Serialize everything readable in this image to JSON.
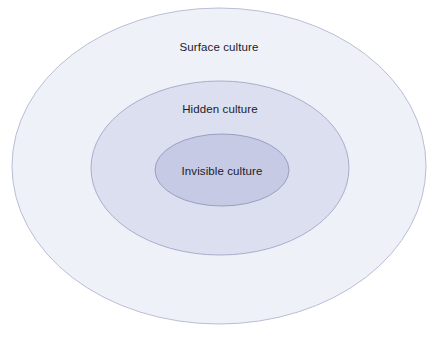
{
  "diagram": {
    "type": "concentric-ellipses",
    "background_color": "#ffffff",
    "title": "",
    "layers": [
      {
        "id": "surface",
        "label": "Surface culture",
        "order": 1,
        "position": "outer",
        "fill_color": "#eef1f8",
        "stroke_color": "#b9bed6",
        "center": {
          "x": 219,
          "y": 166
        },
        "radius": {
          "x": 207,
          "y": 158
        },
        "label_position": {
          "x": 219,
          "y": 48
        }
      },
      {
        "id": "hidden",
        "label": "Hidden culture",
        "order": 2,
        "position": "middle",
        "fill_color": "#dcdff0",
        "stroke_color": "#a9aecb",
        "center": {
          "x": 220,
          "y": 168
        },
        "radius": {
          "x": 129,
          "y": 87
        },
        "label_position": {
          "x": 220,
          "y": 110
        }
      },
      {
        "id": "invisible",
        "label": "Invisible culture",
        "order": 3,
        "position": "inner",
        "fill_color": "#c7cae5",
        "stroke_color": "#9a9fc0",
        "center": {
          "x": 222,
          "y": 170
        },
        "radius": {
          "x": 67,
          "y": 36
        },
        "label_position": {
          "x": 222,
          "y": 172
        }
      }
    ],
    "text_color": "#1b1b2b"
  }
}
